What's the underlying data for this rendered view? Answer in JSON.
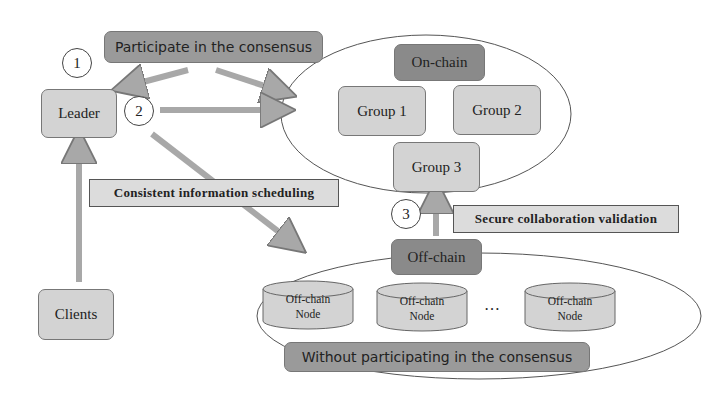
{
  "diagram": {
    "top_label": "Participate in the consensus",
    "bottom_label": "Without participating in the consensus",
    "steps": [
      "1",
      "2",
      "3"
    ],
    "nodes": {
      "leader": "Leader",
      "clients": "Clients",
      "on_chain": "On-chain",
      "off_chain": "Off-chain",
      "groups": [
        "Group 1",
        "Group 2",
        "Group 3"
      ],
      "off_chain_nodes": [
        {
          "line1": "Off-chain",
          "line2": "Node"
        },
        {
          "line1": "Off-chain",
          "line2": "Node"
        },
        {
          "line1": "Off-chain",
          "line2": "Node"
        }
      ],
      "ellipsis": "…"
    },
    "edge_labels": {
      "scheduling": "Consistent information scheduling",
      "validation": "Secure collaboration validation"
    },
    "colors": {
      "light_box": "#d3d3d3",
      "dark_box": "#8a8a8a",
      "arrow": "#a8a8a8",
      "outline": "#555555"
    }
  }
}
